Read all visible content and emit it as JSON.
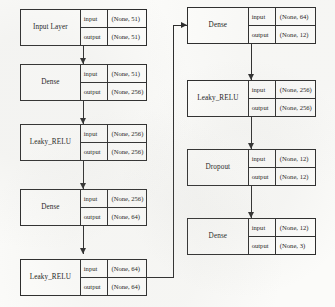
{
  "diagram": {
    "io_labels": {
      "input": "input",
      "output": "output"
    },
    "colors": {
      "stroke": "#2b2b2b",
      "box_fill": "#fdfdfb",
      "page": "#fbfbf9"
    },
    "left_column": [
      {
        "id": "input-layer",
        "name": "Input Layer",
        "input_shape": "(None, 51)",
        "output_shape": "(None, 51)"
      },
      {
        "id": "dense-1",
        "name": "Dense",
        "input_shape": "(None, 51)",
        "output_shape": "(None, 256)"
      },
      {
        "id": "leaky-relu-1",
        "name": "Leaky_RELU",
        "input_shape": "(None, 256)",
        "output_shape": "(None, 256)"
      },
      {
        "id": "dense-2",
        "name": "Dense",
        "input_shape": "(None, 256)",
        "output_shape": "(None, 64)"
      },
      {
        "id": "leaky-relu-2",
        "name": "Leaky_RELU",
        "input_shape": "(None, 64)",
        "output_shape": "(None, 64)"
      }
    ],
    "right_column": [
      {
        "id": "dense-3",
        "name": "Dense",
        "input_shape": "(None, 64)",
        "output_shape": "(None, 12)"
      },
      {
        "id": "leaky-relu-3",
        "name": "Leaky_RELU",
        "input_shape": "(None, 256)",
        "output_shape": "(None, 256)"
      },
      {
        "id": "dropout-1",
        "name": "Dropout",
        "input_shape": "(None, 12)",
        "output_shape": "(None, 12)"
      },
      {
        "id": "dense-4",
        "name": "Dense",
        "input_shape": "(None, 12)",
        "output_shape": "(None, 3)"
      }
    ]
  }
}
